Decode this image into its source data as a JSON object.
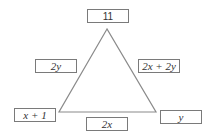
{
  "diagram": {
    "shape": "triangle",
    "stroke_color": "#8a8a8a",
    "box_border_color": "#7a7a7a",
    "triangle": {
      "apex": [
        107,
        29
      ],
      "bottom_left": [
        59,
        112
      ],
      "bottom_right": [
        156,
        112
      ]
    },
    "labels": {
      "top_vertex": "11",
      "left_side": "2y",
      "right_side": "2x + 2y",
      "bottom_left_vertex": "x + 1",
      "bottom_side": "2x",
      "bottom_right_vertex": "y"
    }
  }
}
